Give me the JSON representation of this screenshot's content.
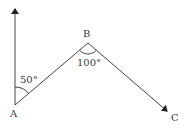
{
  "diagram": {
    "points": [
      {
        "id": "A",
        "label": "A",
        "x": 15,
        "y": 105
      },
      {
        "id": "B",
        "label": "B",
        "x": 88,
        "y": 43
      },
      {
        "id": "C",
        "label": "C",
        "x": 168,
        "y": 112
      }
    ],
    "north_arrow": {
      "from": [
        15,
        105
      ],
      "to": [
        15,
        8
      ]
    },
    "angles": [
      {
        "at": "A",
        "label": "50°",
        "between": [
          "north",
          "AB"
        ]
      },
      {
        "at": "B",
        "label": "100°",
        "between": [
          "BA",
          "BC"
        ]
      }
    ],
    "labels": {
      "A": "A",
      "B": "B",
      "C": "C",
      "angle_A": "50°",
      "angle_B": "100°"
    },
    "colors": {
      "stroke": "#444444",
      "text": "#3a3a3a",
      "background": "#ffffff"
    }
  }
}
